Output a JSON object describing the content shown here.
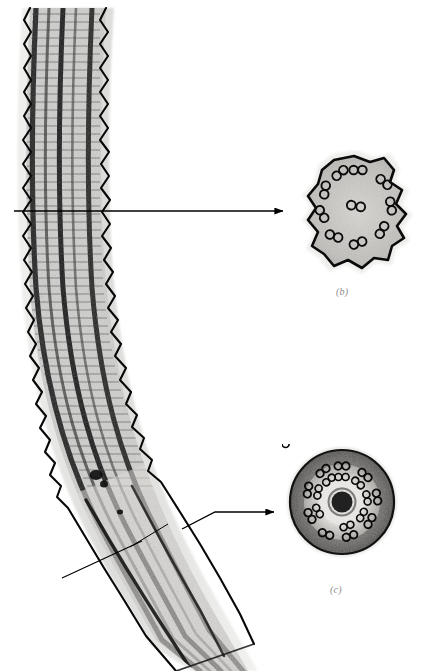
{
  "figure": {
    "kind": "electron-micrograph-composite",
    "background_color": "#ffffff",
    "ink_color": "#000000",
    "label_color": "#8c8c8c",
    "width": 422,
    "height": 671
  },
  "panels": [
    {
      "id": "a",
      "name": "longitudinal-section",
      "label": "",
      "label_visible": false,
      "description": "Longitudinal section of flagellum, curving from top-left down to bottom-right, with sawtooth plasma membrane margins and dark longitudinal microtubule bands.",
      "bounds": {
        "x": 12,
        "y": 8,
        "width": 248,
        "height": 663
      },
      "halo_color": "#e2e2e0",
      "band_color": "#191919"
    },
    {
      "id": "b",
      "name": "cross-section-irregular",
      "label": "(b)",
      "label_visible": true,
      "description": "Irregular star-shaped cross-section showing nine outer microtubule doublets plus a central pair.",
      "bounds": {
        "x": 296,
        "y": 150,
        "width": 126,
        "height": 130
      },
      "outer_doublet_count": 9,
      "central_pair_count": 1,
      "outline_shape": "irregular-lobed"
    },
    {
      "id": "c",
      "name": "cross-section-circular",
      "label": "(c)",
      "label_visible": true,
      "description": "Round cross-section with a dense ring of microtubule doublets surrounding a dark central core.",
      "bounds": {
        "x": 282,
        "y": 444,
        "width": 120,
        "height": 122
      },
      "outer_doublet_count": 9,
      "inner_doublet_count": 9,
      "central_core": true,
      "outline_shape": "circular"
    }
  ],
  "annotations": [
    {
      "id": "arrow-to-b",
      "name": "arrow-to-panel-b",
      "type": "straight-arrow",
      "from": {
        "x": 14,
        "y": 211
      },
      "to": {
        "x": 283,
        "y": 211
      },
      "points": "14,211 283,211",
      "has_head": true
    },
    {
      "id": "arrow-to-c",
      "name": "arrow-to-panel-c",
      "type": "bent-arrow",
      "from": {
        "x": 182,
        "y": 529
      },
      "to": {
        "x": 274,
        "y": 512
      },
      "points": "182,529 215,512 274,512",
      "has_head": true
    },
    {
      "id": "leader-lower",
      "name": "leader-line-lower",
      "type": "plain-leader",
      "from": {
        "x": 62,
        "y": 578
      },
      "to": {
        "x": 142,
        "y": 541
      },
      "points": "62,578 142,541",
      "has_head": false
    },
    {
      "id": "leader-inner",
      "name": "leader-line-inner",
      "type": "plain-leader",
      "from": {
        "x": 130,
        "y": 547
      },
      "to": {
        "x": 168,
        "y": 524
      },
      "points": "130,547 168,524",
      "has_head": false
    }
  ]
}
